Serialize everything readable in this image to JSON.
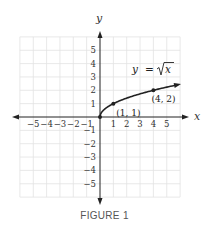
{
  "caption": "FIGURE 1",
  "chart_data": {
    "type": "line",
    "title": "",
    "function_label": "y = √x",
    "function_label_parts": {
      "lhs": "y",
      "eq": "=",
      "radicand": "x"
    },
    "xlabel": "x",
    "ylabel": "y",
    "xlim": [
      -6,
      6
    ],
    "ylim": [
      -6,
      6
    ],
    "grid": true,
    "x_ticks": [
      -5,
      -4,
      -3,
      -2,
      -1,
      1,
      2,
      3,
      4,
      5
    ],
    "x_tick_labels": [
      "−5",
      "−4",
      "−3",
      "−2",
      "−1",
      "1",
      "2",
      "3",
      "4",
      "5"
    ],
    "y_ticks": [
      5,
      4,
      3,
      2,
      1,
      -1,
      -2,
      -3,
      -4,
      -5
    ],
    "y_tick_labels": [
      "5",
      "4",
      "3",
      "2",
      "1",
      "−1",
      "−2",
      "−3",
      "−4",
      "−5"
    ],
    "series": [
      {
        "name": "y = √x",
        "x": [
          0,
          0.25,
          0.5,
          1,
          2,
          3,
          4,
          5,
          5.85
        ],
        "y": [
          0,
          0.5,
          0.707,
          1,
          1.414,
          1.732,
          2,
          2.236,
          2.42
        ],
        "arrow_end": true
      }
    ],
    "points": [
      {
        "x": 0,
        "y": 0,
        "label": ""
      },
      {
        "x": 1,
        "y": 1,
        "label": "(1, 1)"
      },
      {
        "x": 4,
        "y": 2,
        "label": "(4, 2)"
      }
    ],
    "colors": {
      "curve": "#222222",
      "axes": "#222222",
      "grid": "#e2e2e2"
    }
  }
}
